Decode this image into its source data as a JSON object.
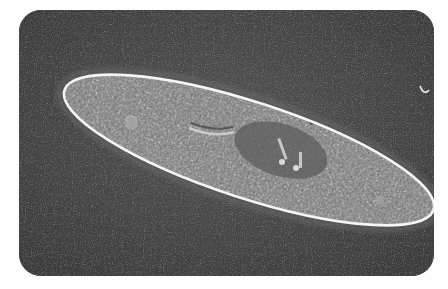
{
  "image": {
    "subject": "Paramecium (phase-contrast micrograph)",
    "alt": "Phase-contrast micrograph of a paramecium: an elongated, slipper-shaped single-celled organism with a bright outline, granular cytoplasm, and a darker central nucleus region, on a dark gray background",
    "colors": {
      "background": "#4a4a4a",
      "cell_fill": "#8a8a8a",
      "outline": "#f2f2f2",
      "nucleus": "#5e5e5e"
    }
  }
}
